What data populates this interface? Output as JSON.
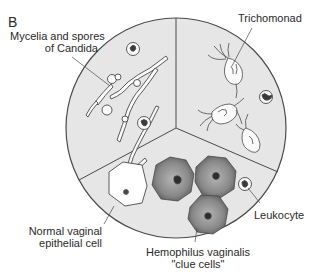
{
  "figure": {
    "panel_letter": "B",
    "colors": {
      "background": "#ffffff",
      "field_fill": "#e6e6e6",
      "outline": "#4a4a4a",
      "clue_cell_fill": "#8c8c8c",
      "nucleus": "#3a3a3a"
    }
  },
  "labels": {
    "candida_line1": "Mycelia and spores",
    "candida_line2": "of Candida",
    "trichomonad": "Trichomonad",
    "epithelial_line1": "Normal vaginal",
    "epithelial_line2": "epithelial cell",
    "clue_line1": "Hemophilus vaginalis",
    "clue_line2": "\"clue cells\"",
    "leukocyte": "Leukocyte"
  },
  "sectors": [
    {
      "name": "candida-sector",
      "contents": [
        "mycelia",
        "spores",
        "leukocytes"
      ]
    },
    {
      "name": "trichomonad-sector",
      "contents": [
        "trichomonads",
        "leukocyte"
      ]
    },
    {
      "name": "bottom-sector",
      "contents": [
        "normal epithelial cell",
        "clue cells",
        "leukocyte"
      ]
    }
  ]
}
